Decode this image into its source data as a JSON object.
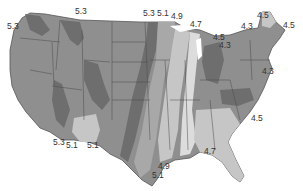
{
  "map": {
    "subject": "Contiguous United States contour map",
    "colors": {
      "background": "#ffffff",
      "land_base": "#8f8f8f",
      "dark_band": "#6e6e6e",
      "mid_band": "#a8a8a8",
      "light_band": "#c6c6c6",
      "lightest_band": "#dcdcdc",
      "state_lines": "#4a4a4a"
    },
    "contour_labels": [
      {
        "id": "wa-west",
        "value": "5.3",
        "x": 7,
        "y": 27
      },
      {
        "id": "wa-north",
        "value": "5.3",
        "x": 75,
        "y": 12
      },
      {
        "id": "nd-east-1",
        "value": "5.3",
        "x": 144,
        "y": 14
      },
      {
        "id": "nd-east-2",
        "value": "5.1",
        "x": 157,
        "y": 14
      },
      {
        "id": "mn",
        "value": "4.9",
        "x": 171,
        "y": 17
      },
      {
        "id": "mi-north",
        "value": "4.7",
        "x": 190,
        "y": 26
      },
      {
        "id": "me-west",
        "value": "4.5",
        "x": 257,
        "y": 16
      },
      {
        "id": "me-east",
        "value": "4.5",
        "x": 283,
        "y": 26
      },
      {
        "id": "ny-north",
        "value": "4.3",
        "x": 241,
        "y": 27
      },
      {
        "id": "oh-1",
        "value": "4.5",
        "x": 213,
        "y": 38
      },
      {
        "id": "oh-2",
        "value": "4.3",
        "x": 219,
        "y": 46
      },
      {
        "id": "mid-atlantic",
        "value": "4.3",
        "x": 262,
        "y": 72
      },
      {
        "id": "nc-coast",
        "value": "4.5",
        "x": 251,
        "y": 120
      },
      {
        "id": "tx-west-1",
        "value": "5.3",
        "x": 53,
        "y": 143
      },
      {
        "id": "tx-west-2",
        "value": "5.1",
        "x": 66,
        "y": 146
      },
      {
        "id": "tx-mid",
        "value": "5.1",
        "x": 87,
        "y": 146
      },
      {
        "id": "gulf-fl",
        "value": "4.7",
        "x": 204,
        "y": 152
      },
      {
        "id": "tx-coast-1",
        "value": "4.9",
        "x": 158,
        "y": 167
      },
      {
        "id": "tx-coast-2",
        "value": "5.1",
        "x": 152,
        "y": 176
      }
    ]
  }
}
